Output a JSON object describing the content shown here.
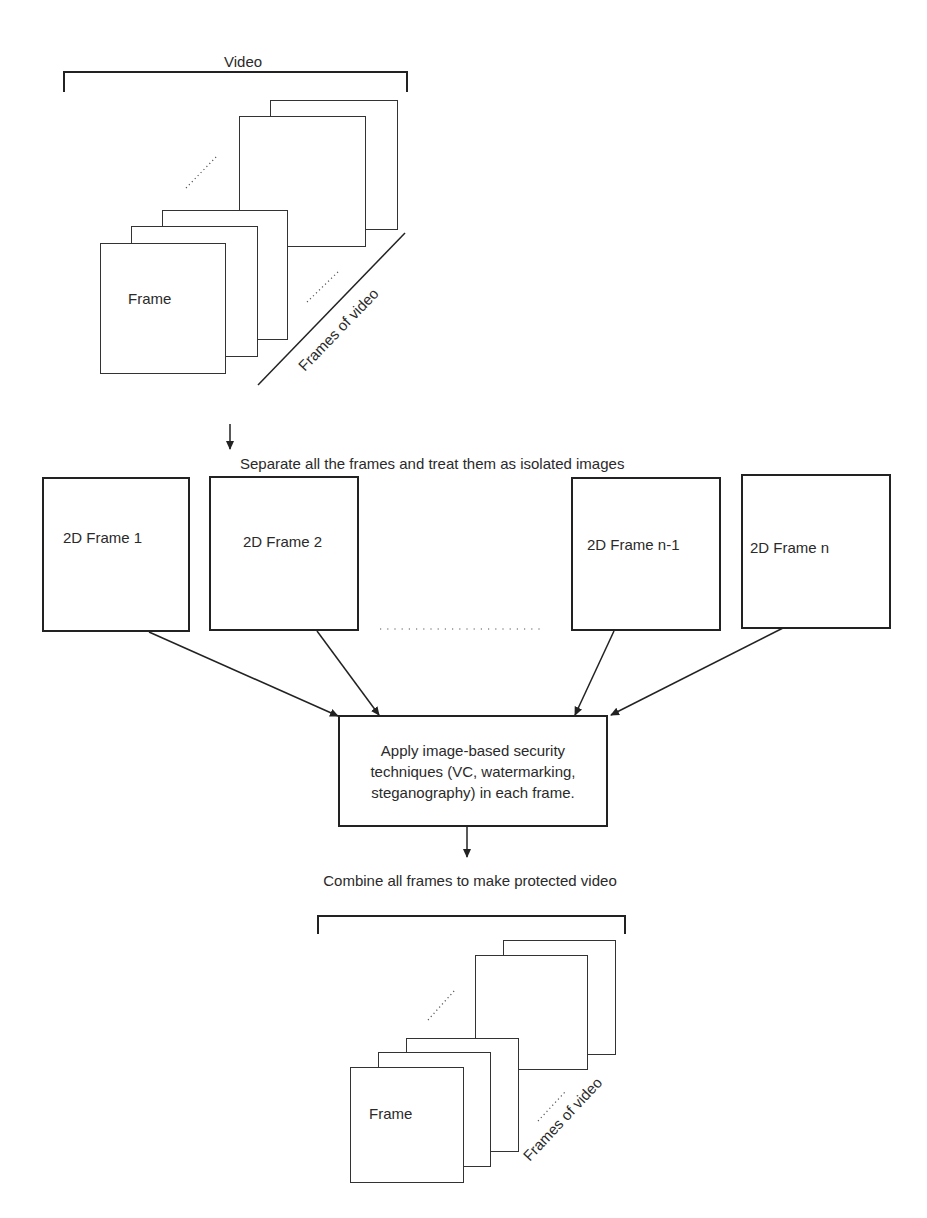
{
  "top_stack": {
    "bracket_label": "Video",
    "front_frame_label": "Frame",
    "diagonal_label": "Frames of video"
  },
  "separate_step": {
    "label": "Separate all the frames and treat them as isolated images"
  },
  "frames": [
    {
      "label": "2D Frame 1"
    },
    {
      "label": "2D Frame 2"
    },
    {
      "label": "2D Frame n-1"
    },
    {
      "label": "2D Frame n"
    }
  ],
  "process_box": {
    "label": "Apply image-based security techniques (VC, watermarking, steganography) in each frame."
  },
  "combine_step": {
    "label": "Combine all frames to make protected video"
  },
  "bottom_stack": {
    "front_frame_label": "Frame",
    "diagonal_label": "Frames of video"
  },
  "colors": {
    "stroke": "#222222",
    "text": "#2a2a2a",
    "background": "#ffffff"
  }
}
